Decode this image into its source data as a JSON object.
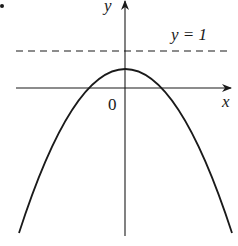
{
  "figure": {
    "type": "function-graph",
    "axes": {
      "x_label": "x",
      "y_label": "y",
      "origin_label": "0"
    },
    "reference_line": {
      "label": "y = 1",
      "style": "dashed",
      "value": 1
    },
    "curve": {
      "shape": "parabola",
      "opening": "down",
      "vertex_above_x_axis": true,
      "vertex_below_reference_line": true
    },
    "colors": {
      "stroke": "#1a1a1a",
      "background": "#ffffff"
    }
  }
}
